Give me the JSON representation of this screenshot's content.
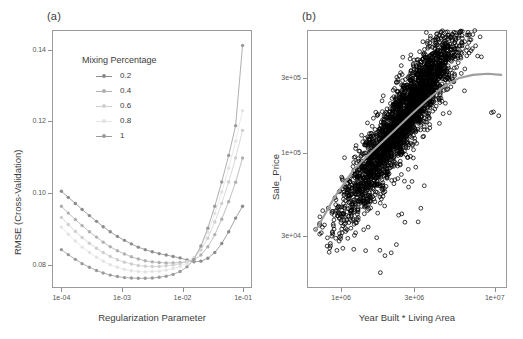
{
  "figure": {
    "panel_a_label": "(a)",
    "panel_b_label": "(b)"
  },
  "chart_data": [
    {
      "id": "panel_a",
      "type": "line",
      "title": "(a)",
      "xlabel": "Regularization Parameter",
      "ylabel": "RMSE (Cross-Validation)",
      "xscale": "log",
      "xlim": [
        7e-05,
        0.14
      ],
      "ylim": [
        0.0735,
        0.1455
      ],
      "xticks": [
        0.0001,
        0.001,
        0.01,
        0.1
      ],
      "xticklabels": [
        "1e-04",
        "1e-03",
        "1e-02",
        "1e-01"
      ],
      "yticks": [
        0.08,
        0.1,
        0.12,
        0.14
      ],
      "yticklabels": [
        "0.08",
        "0.10",
        "0.12",
        "0.14"
      ],
      "grid": false,
      "legend_title": "Mixing Percentage",
      "legend_position": "inside-top-left",
      "series": [
        {
          "name": "0.2",
          "color": "#8c8c8c",
          "x": [
            0.0001,
            0.00013,
            0.00017,
            0.00022,
            0.00029,
            0.00038,
            0.00049,
            0.00064,
            0.00084,
            0.0011,
            0.00143,
            0.00186,
            0.00242,
            0.00316,
            0.00411,
            0.00536,
            0.00698,
            0.00909,
            0.01183,
            0.01541,
            0.02007,
            0.02613,
            0.03403,
            0.04431,
            0.0577,
            0.07515,
            0.0978
          ],
          "values": [
            0.1005,
            0.0988,
            0.0971,
            0.0954,
            0.0937,
            0.0921,
            0.0906,
            0.0892,
            0.0879,
            0.0868,
            0.0858,
            0.0849,
            0.0842,
            0.0836,
            0.0831,
            0.0827,
            0.0823,
            0.0819,
            0.0813,
            0.0808,
            0.081,
            0.0818,
            0.0834,
            0.0859,
            0.0892,
            0.093,
            0.0963
          ]
        },
        {
          "name": "0.4",
          "color": "#b0b0b0",
          "x": [
            0.0001,
            0.00013,
            0.00017,
            0.00022,
            0.00029,
            0.00038,
            0.00049,
            0.00064,
            0.00084,
            0.0011,
            0.00143,
            0.00186,
            0.00242,
            0.00316,
            0.00411,
            0.00536,
            0.00698,
            0.00909,
            0.01183,
            0.01541,
            0.02007,
            0.02613,
            0.03403,
            0.04431,
            0.0577,
            0.07515,
            0.0978
          ],
          "values": [
            0.0963,
            0.0944,
            0.0926,
            0.0909,
            0.0892,
            0.0877,
            0.0863,
            0.085,
            0.0839,
            0.083,
            0.0822,
            0.0816,
            0.0811,
            0.0808,
            0.0806,
            0.0805,
            0.0805,
            0.0806,
            0.0808,
            0.0813,
            0.0827,
            0.085,
            0.0884,
            0.0927,
            0.0976,
            0.103,
            0.1098
          ]
        },
        {
          "name": "0.6",
          "color": "#cfcfcf",
          "x": [
            0.0001,
            0.00013,
            0.00017,
            0.00022,
            0.00029,
            0.00038,
            0.00049,
            0.00064,
            0.00084,
            0.0011,
            0.00143,
            0.00186,
            0.00242,
            0.00316,
            0.00411,
            0.00536,
            0.00698,
            0.00909,
            0.01183,
            0.01541,
            0.02007,
            0.02613,
            0.03403,
            0.04431,
            0.0577,
            0.07515,
            0.0978
          ],
          "values": [
            0.0932,
            0.0912,
            0.0893,
            0.0876,
            0.086,
            0.0846,
            0.0834,
            0.0823,
            0.0814,
            0.0807,
            0.0802,
            0.0798,
            0.0796,
            0.0795,
            0.0795,
            0.0797,
            0.0799,
            0.0803,
            0.0809,
            0.0819,
            0.0841,
            0.0874,
            0.0919,
            0.0971,
            0.1031,
            0.1098,
            0.1175
          ]
        },
        {
          "name": "0.8",
          "color": "#e3e3e3",
          "x": [
            0.0001,
            0.00013,
            0.00017,
            0.00022,
            0.00029,
            0.00038,
            0.00049,
            0.00064,
            0.00084,
            0.0011,
            0.00143,
            0.00186,
            0.00242,
            0.00316,
            0.00411,
            0.00536,
            0.00698,
            0.00909,
            0.01183,
            0.01541,
            0.02007,
            0.02613,
            0.03403,
            0.04431,
            0.0577,
            0.07515,
            0.0978
          ],
          "values": [
            0.0905,
            0.0885,
            0.0866,
            0.0849,
            0.0834,
            0.0821,
            0.081,
            0.08,
            0.0793,
            0.0787,
            0.0783,
            0.0781,
            0.078,
            0.0781,
            0.0782,
            0.0785,
            0.0789,
            0.0795,
            0.0804,
            0.082,
            0.0849,
            0.089,
            0.0943,
            0.1003,
            0.1069,
            0.1145,
            0.123
          ]
        },
        {
          "name": "1",
          "color": "#9a9a9a",
          "x": [
            0.0001,
            0.00013,
            0.00017,
            0.00022,
            0.00029,
            0.00038,
            0.00049,
            0.00064,
            0.00084,
            0.0011,
            0.00143,
            0.00186,
            0.00242,
            0.00316,
            0.00411,
            0.00536,
            0.00698,
            0.00909,
            0.01183,
            0.01541,
            0.02007,
            0.02613,
            0.03403,
            0.04431,
            0.0577,
            0.07515,
            0.0978
          ],
          "values": [
            0.0842,
            0.0828,
            0.0815,
            0.0803,
            0.0793,
            0.0784,
            0.0777,
            0.0771,
            0.0767,
            0.0764,
            0.0763,
            0.0762,
            0.0762,
            0.0763,
            0.0765,
            0.0768,
            0.0773,
            0.0781,
            0.0794,
            0.0815,
            0.0852,
            0.0902,
            0.0963,
            0.1031,
            0.1105,
            0.1188,
            0.1412
          ]
        }
      ]
    },
    {
      "id": "panel_b",
      "type": "scatter",
      "title": "(b)",
      "xlabel": "Year Built * Living Area",
      "ylabel": "Sale_Price",
      "xscale": "log",
      "yscale": "log",
      "xlim": [
        600000,
        12000000
      ],
      "ylim": [
        14000,
        600000
      ],
      "xticks": [
        1000000,
        3000000,
        10000000
      ],
      "xticklabels": [
        "1e+06",
        "3e+06",
        "1e+07"
      ],
      "yticks": [
        30000,
        100000,
        300000
      ],
      "yticklabels": [
        "3e+04",
        "1e+05",
        "3e+05"
      ],
      "grid": false,
      "point_color": "#000000",
      "smoother_color": "#9e9e9e",
      "n_points": 2930,
      "smoother": {
        "x": [
          680000,
          900000,
          1200000,
          1600000,
          2100000,
          2800000,
          3600000,
          4600000,
          5800000,
          7200000,
          9000000,
          11000000
        ],
        "y": [
          32000,
          52000,
          78000,
          103000,
          132000,
          172000,
          215000,
          262000,
          297000,
          312000,
          317000,
          312000
        ]
      }
    }
  ]
}
